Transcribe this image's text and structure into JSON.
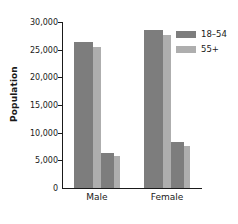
{
  "chart_data": {
    "type": "bar",
    "title": "",
    "xlabel": "",
    "ylabel": "Population",
    "categories": [
      "Male",
      "Female"
    ],
    "ylim": [
      0,
      30000
    ],
    "yticks": [
      0,
      5000,
      10000,
      15000,
      20000,
      25000,
      30000
    ],
    "ytick_labels": [
      "0",
      "5,000",
      "10,000",
      "15,000",
      "20,000",
      "25,000",
      "30,000"
    ],
    "grid": false,
    "legend_position": "top-right",
    "series": [
      {
        "name": "18–54",
        "color": "#7d7d7d",
        "values": [
          26300,
          28500
        ]
      },
      {
        "name": "55+",
        "color": "#aeaeae",
        "values": [
          25400,
          27700
        ]
      },
      {
        "name": "18–54",
        "color": "#7d7d7d",
        "values": [
          6400,
          8300
        ]
      },
      {
        "name": "55+",
        "color": "#aeaeae",
        "values": [
          5700,
          7600
        ]
      }
    ],
    "legend": [
      {
        "label": "18–54",
        "color": "#7d7d7d"
      },
      {
        "label": "55+",
        "color": "#aeaeae"
      }
    ],
    "colors": {
      "series_dark": "#7d7d7d",
      "series_light": "#aeaeae",
      "axis": "#1a1a1a",
      "text": "#1a1a1a",
      "background": "#ffffff"
    }
  }
}
